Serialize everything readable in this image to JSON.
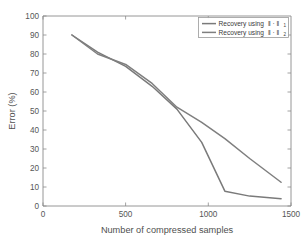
{
  "chart_data": {
    "type": "line",
    "title": "",
    "xlabel": "Number of compressed samples",
    "ylabel": "Error (%)",
    "xlim": [
      0,
      1500
    ],
    "ylim": [
      0,
      100
    ],
    "xticks": [
      0,
      500,
      1000,
      1500
    ],
    "yticks": [
      0,
      10,
      20,
      30,
      40,
      50,
      60,
      70,
      80,
      90,
      100
    ],
    "xtick_labels": [
      "0",
      "500",
      "1000",
      "1500"
    ],
    "ytick_labels": [
      "0",
      "10",
      "20",
      "30",
      "40",
      "50",
      "60",
      "70",
      "80",
      "90",
      "100"
    ],
    "grid": false,
    "legend_position": "upper right",
    "series": [
      {
        "name": "Recovery using ‖ · ‖",
        "name_base": "Recovery using ‖ · ‖",
        "name_subscript": "1",
        "color": "#7a7a7a",
        "x": [
          175,
          330,
          500,
          660,
          810,
          960,
          1100,
          1250,
          1440
        ],
        "y": [
          90,
          81,
          73.5,
          63,
          51,
          33.5,
          7.8,
          5.2,
          3.8
        ]
      },
      {
        "name": "Recovery using ‖ · ‖",
        "name_base": "Recovery using ‖ · ‖",
        "name_subscript": "2",
        "color": "#7f7f7f",
        "x": [
          175,
          330,
          500,
          660,
          810,
          960,
          1100,
          1250,
          1440
        ],
        "y": [
          90,
          80,
          74.5,
          64.5,
          52,
          44,
          35.5,
          25,
          12.5
        ]
      }
    ]
  },
  "legend": {
    "entries": [
      {
        "label_base": "Recovery using",
        "norm": "‖ · ‖",
        "subscript": "1"
      },
      {
        "label_base": "Recovery using",
        "norm": "‖ · ‖",
        "subscript": "2"
      }
    ]
  },
  "axes": {
    "x_axis_label": "Number of compressed samples",
    "y_axis_label": "Error (%)"
  },
  "colors": {
    "background": "#ffffff",
    "axis": "#8a8a8a",
    "series_1": "#7a7a7a",
    "series_2": "#7f7f7f",
    "text": "#4a4a4a"
  }
}
